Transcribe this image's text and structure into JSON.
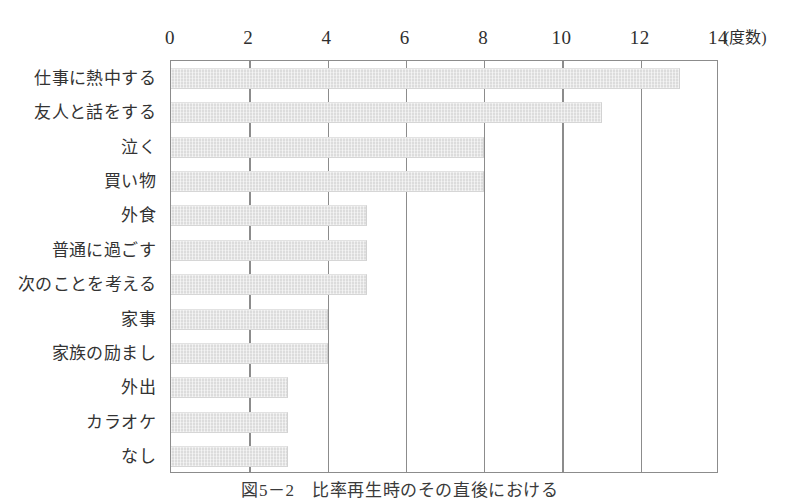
{
  "figure": {
    "caption": "図5－2　比率再生時のその直後における",
    "axis_unit_label": "(度数)"
  },
  "chart_data": {
    "type": "bar",
    "orientation": "horizontal",
    "title": "",
    "subtitle": "",
    "xlabel": "(度数)",
    "ylabel": "",
    "xlim": [
      0,
      14
    ],
    "xticks": [
      0,
      2,
      4,
      6,
      8,
      10,
      12,
      14
    ],
    "xtick_labels": [
      "0",
      "2",
      "4",
      "6",
      "8",
      "10",
      "12",
      "14"
    ],
    "grid": true,
    "grid_axis": "x",
    "axis_position": "top",
    "legend": null,
    "bar_color": "#dcdcdc",
    "bar_edge_color": "#d2d2d2",
    "axis_color": "#8c8c8c",
    "categories": [
      "仕事に熱中する",
      "友人と話をする",
      "泣く",
      "買い物",
      "外食",
      "普通に過ごす",
      "次のことを考える",
      "家事",
      "家族の励まし",
      "外出",
      "カラオケ",
      "なし"
    ],
    "values": [
      13,
      11,
      8,
      8,
      5,
      5,
      5,
      4,
      4,
      3,
      3,
      3
    ]
  }
}
